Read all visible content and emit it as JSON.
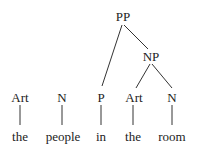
{
  "tree": {
    "nodes": [
      {
        "id": "pp",
        "label": "PP",
        "x": 123,
        "y": 10
      },
      {
        "id": "np",
        "label": "NP",
        "x": 151,
        "y": 50
      },
      {
        "id": "art1",
        "label": "Art",
        "x": 20,
        "y": 91
      },
      {
        "id": "n1",
        "label": "N",
        "x": 62,
        "y": 91
      },
      {
        "id": "p",
        "label": "P",
        "x": 101,
        "y": 91
      },
      {
        "id": "art2",
        "label": "Art",
        "x": 134,
        "y": 91
      },
      {
        "id": "n2",
        "label": "N",
        "x": 172,
        "y": 91
      }
    ],
    "words": [
      {
        "id": "w1",
        "label": "the",
        "x": 20,
        "y": 130
      },
      {
        "id": "w2",
        "label": "people",
        "x": 63,
        "y": 130
      },
      {
        "id": "w3",
        "label": "in",
        "x": 101,
        "y": 130
      },
      {
        "id": "w4",
        "label": "the",
        "x": 133,
        "y": 130
      },
      {
        "id": "w5",
        "label": "room",
        "x": 172,
        "y": 130
      }
    ]
  }
}
